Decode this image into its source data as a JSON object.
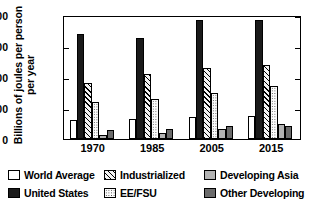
{
  "chart_data": {
    "type": "bar",
    "title": "",
    "xlabel": "",
    "ylabel": "Billions of joules per person per year",
    "categories": [
      "1970",
      "1985",
      "2005",
      "2015"
    ],
    "ylim": [
      0,
      400
    ],
    "yticks": [
      0,
      100,
      200,
      300,
      400
    ],
    "grid": false,
    "legend_position": "bottom",
    "series": [
      {
        "name": "World Average",
        "values": [
          60,
          63,
          70,
          75
        ],
        "color": "#ffffff",
        "pattern": "solid-white"
      },
      {
        "name": "United States",
        "values": [
          340,
          327,
          383,
          385
        ],
        "color": "#1a1a1a",
        "pattern": "solid-black"
      },
      {
        "name": "Industrialized",
        "values": [
          180,
          210,
          228,
          240
        ],
        "color": "#f2f2f2",
        "pattern": "diagonal-hatch"
      },
      {
        "name": "EE/FSU",
        "values": [
          120,
          130,
          150,
          172
        ],
        "color": "#fbfbfb",
        "pattern": "dotted-stipple"
      },
      {
        "name": "Developing Asia",
        "values": [
          13,
          18,
          33,
          48
        ],
        "color": "#b3b3b3",
        "pattern": "solid-light-gray"
      },
      {
        "name": "Other Developing",
        "values": [
          30,
          33,
          42,
          42
        ],
        "color": "#6b6b6b",
        "pattern": "solid-dark-gray"
      }
    ]
  }
}
